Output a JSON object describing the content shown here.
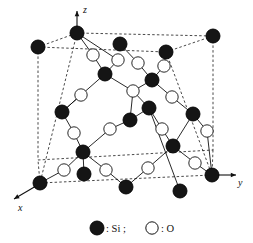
{
  "figure": {
    "projection": "oblique",
    "background_color": "#ffffff",
    "line_color": "#1a1a1a",
    "cell_edge_style": "dashed"
  },
  "axes": [
    {
      "name": "z-axis",
      "label": "z",
      "direction": "up",
      "tip": [
        77,
        11
      ],
      "tail": [
        77,
        31
      ],
      "label_pos": [
        83,
        13
      ]
    },
    {
      "name": "y-axis",
      "label": "y",
      "direction": "right",
      "tip": [
        236,
        175
      ],
      "tail": [
        216,
        175
      ],
      "label_pos": [
        238,
        186
      ]
    },
    {
      "name": "x-axis",
      "label": "x",
      "direction": "down-left",
      "tip": [
        14,
        199
      ],
      "tail": [
        36,
        186
      ],
      "label_pos": [
        18,
        211
      ]
    }
  ],
  "cell": {
    "name": "unit-cell-wireframe",
    "corners": {
      "top_back_left": [
        38,
        47
      ],
      "top_back_right": [
        213,
        36
      ],
      "top_front_left": [
        77,
        33
      ],
      "top_front_right": [
        166,
        52
      ],
      "bot_back_left": [
        38,
        160
      ],
      "bot_back_right": [
        213,
        150
      ],
      "bot_front_left": [
        40,
        183
      ],
      "bot_front_right": [
        212,
        175
      ]
    },
    "edges": [
      [
        "top_back_left",
        "top_front_left"
      ],
      [
        "top_front_left",
        "top_back_right"
      ],
      [
        "top_back_left",
        "top_front_right"
      ],
      [
        "top_front_right",
        "top_back_right"
      ],
      [
        "bot_front_left",
        "bot_back_left"
      ],
      [
        "bot_back_left",
        "bot_back_right"
      ],
      [
        "bot_back_right",
        "bot_front_right"
      ],
      [
        "bot_front_right",
        "bot_front_left"
      ],
      [
        "top_back_left",
        "bot_back_left"
      ],
      [
        "top_front_left",
        "bot_front_left"
      ],
      [
        "top_back_right",
        "bot_back_right"
      ],
      [
        "top_front_right",
        "bot_front_right"
      ]
    ]
  },
  "atom_types": {
    "Si": {
      "label": "Si",
      "fill": "#151515",
      "stroke": "#000000",
      "radius": 7.0,
      "name": "silicon-atom"
    },
    "O": {
      "label": "O",
      "fill": "#ffffff",
      "stroke": "#111111",
      "radius": 6.2,
      "name": "oxygen-atom"
    }
  },
  "atoms": [
    {
      "id": "si1",
      "el": "Si",
      "x": 38,
      "y": 47
    },
    {
      "id": "si2",
      "el": "Si",
      "x": 77,
      "y": 33
    },
    {
      "id": "si3",
      "el": "Si",
      "x": 213,
      "y": 36
    },
    {
      "id": "si4",
      "el": "Si",
      "x": 166,
      "y": 52
    },
    {
      "id": "si5",
      "el": "Si",
      "x": 40,
      "y": 183
    },
    {
      "id": "si6",
      "el": "Si",
      "x": 180,
      "y": 191
    },
    {
      "id": "si7",
      "el": "Si",
      "x": 212,
      "y": 175
    },
    {
      "id": "si8",
      "el": "Si",
      "x": 120,
      "y": 44
    },
    {
      "id": "si9",
      "el": "Si",
      "x": 105,
      "y": 74
    },
    {
      "id": "si10",
      "el": "Si",
      "x": 152,
      "y": 80
    },
    {
      "id": "si11",
      "el": "Si",
      "x": 62,
      "y": 112
    },
    {
      "id": "si12",
      "el": "Si",
      "x": 130,
      "y": 120
    },
    {
      "id": "si13",
      "el": "Si",
      "x": 149,
      "y": 108
    },
    {
      "id": "si14",
      "el": "Si",
      "x": 193,
      "y": 114
    },
    {
      "id": "si15",
      "el": "Si",
      "x": 83,
      "y": 152
    },
    {
      "id": "si16",
      "el": "Si",
      "x": 173,
      "y": 146
    },
    {
      "id": "si17",
      "el": "Si",
      "x": 84,
      "y": 174
    },
    {
      "id": "si18",
      "el": "Si",
      "x": 126,
      "y": 187
    },
    {
      "id": "o1",
      "el": "O",
      "x": 93,
      "y": 55
    },
    {
      "id": "o2",
      "el": "O",
      "x": 118,
      "y": 60
    },
    {
      "id": "o3",
      "el": "O",
      "x": 138,
      "y": 63
    },
    {
      "id": "o4",
      "el": "O",
      "x": 164,
      "y": 66
    },
    {
      "id": "o5",
      "el": "O",
      "x": 81,
      "y": 95
    },
    {
      "id": "o6",
      "el": "O",
      "x": 133,
      "y": 91
    },
    {
      "id": "o7",
      "el": "O",
      "x": 172,
      "y": 97
    },
    {
      "id": "o8",
      "el": "O",
      "x": 74,
      "y": 133
    },
    {
      "id": "o9",
      "el": "O",
      "x": 110,
      "y": 129
    },
    {
      "id": "o10",
      "el": "O",
      "x": 162,
      "y": 129
    },
    {
      "id": "o11",
      "el": "O",
      "x": 207,
      "y": 131
    },
    {
      "id": "o12",
      "el": "O",
      "x": 64,
      "y": 170
    },
    {
      "id": "o13",
      "el": "O",
      "x": 106,
      "y": 170
    },
    {
      "id": "o14",
      "el": "O",
      "x": 148,
      "y": 168
    },
    {
      "id": "o15",
      "el": "O",
      "x": 195,
      "y": 163
    }
  ],
  "bonds": [
    [
      "si2",
      "o1"
    ],
    [
      "o1",
      "si9"
    ],
    [
      "si2",
      "o2"
    ],
    [
      "o2",
      "si9"
    ],
    [
      "si8",
      "o3"
    ],
    [
      "o3",
      "si10"
    ],
    [
      "si4",
      "o4"
    ],
    [
      "o4",
      "si10"
    ],
    [
      "si9",
      "o5"
    ],
    [
      "o5",
      "si11"
    ],
    [
      "si9",
      "o6"
    ],
    [
      "o6",
      "si10"
    ],
    [
      "si10",
      "o7"
    ],
    [
      "o7",
      "si14"
    ],
    [
      "si11",
      "o8"
    ],
    [
      "o8",
      "si15"
    ],
    [
      "si12",
      "o9"
    ],
    [
      "o9",
      "si15"
    ],
    [
      "si6",
      "si13"
    ],
    [
      "si13",
      "o6"
    ],
    [
      "si12",
      "o6"
    ],
    [
      "si13",
      "o10"
    ],
    [
      "o10",
      "si16"
    ],
    [
      "si14",
      "o11"
    ],
    [
      "o11",
      "si7"
    ],
    [
      "si15",
      "o12"
    ],
    [
      "o12",
      "si5"
    ],
    [
      "si15",
      "o13"
    ],
    [
      "o13",
      "si18"
    ],
    [
      "si16",
      "o14"
    ],
    [
      "o14",
      "si18"
    ],
    [
      "si16",
      "o15"
    ],
    [
      "o15",
      "si7"
    ],
    [
      "si15",
      "si17"
    ],
    [
      "si14",
      "si16"
    ],
    [
      "si11",
      "o5"
    ],
    [
      "si12",
      "si13"
    ]
  ],
  "legend": {
    "name": "legend",
    "si_marker": "filled-circle",
    "si_separator": ": Si ;",
    "o_marker": "open-circle",
    "o_separator": ": O",
    "si_label": "Si",
    "o_label": "O",
    "colon": ":",
    "semicolon": ";",
    "si_text": ": Si ;",
    "o_text": ": O",
    "pos": {
      "si_circle": [
        97,
        228
      ],
      "o_circle": [
        152,
        228
      ]
    }
  }
}
